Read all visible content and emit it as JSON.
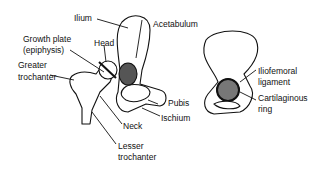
{
  "diagram": {
    "left_figure": {
      "labels": {
        "ilium": "Ilium",
        "acetabulum": "Acetabulum",
        "growth_plate_1": "Growth plate",
        "growth_plate_2": "(epiphysis)",
        "head": "Head",
        "greater_trochanter_1": "Greater",
        "greater_trochanter_2": "trochanter",
        "pubis": "Pubis",
        "ischium": "Ischium",
        "neck": "Neck",
        "lesser_trochanter_1": "Lesser",
        "lesser_trochanter_2": "trochanter"
      }
    },
    "right_figure": {
      "labels": {
        "iliofemoral_1": "Iliofemoral",
        "iliofemoral_2": "ligament",
        "cartilaginous_1": "Cartilaginous",
        "cartilaginous_2": "ring"
      }
    }
  }
}
